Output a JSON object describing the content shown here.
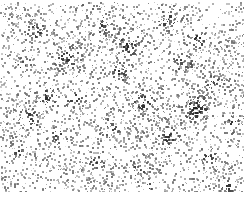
{
  "figure": {
    "title": "",
    "caption": "",
    "width": 251,
    "height": 197,
    "background_color": "#ffffff",
    "dot_color": "#6e6e6e",
    "dot_color_dark": "#1a1a1a",
    "frame": "none",
    "axes_visible": false,
    "ticks_visible": false,
    "labels_visible": false
  },
  "chart_data": {
    "type": "scatter",
    "title": "",
    "subtitle": "",
    "xlabel": "",
    "ylabel": "",
    "xlim": [
      0,
      251
    ],
    "ylim": [
      0,
      197
    ],
    "grid": false,
    "legend": null,
    "annotations": [],
    "tick_labels_x": [],
    "tick_labels_y": [],
    "description": "Dense two-dimensional random point pattern: roughly 3800 small grey markers scattered across a white field, with clustered over-dense knots and low-density voids.",
    "marker": {
      "shape": "square",
      "size_px": 2,
      "base_color": "#6e6e6e",
      "cluster_color": "#1a1a1a",
      "opacity_range": [
        0.35,
        1.0
      ]
    },
    "point_count": 3800,
    "content_bounds": {
      "left": 0,
      "top": 2,
      "right": 244,
      "bottom": 192
    },
    "margins": {
      "left": 0,
      "top": 2,
      "right": 7,
      "bottom": 5
    },
    "field": {
      "seed": 20240917,
      "base_density": 0.0825,
      "background_jitter": 0.55
    },
    "clusters": [
      {
        "cx": 36,
        "cy": 30,
        "radius": 9,
        "weight": 0.55,
        "darkness": 0.85
      },
      {
        "cx": 66,
        "cy": 57,
        "radius": 11,
        "weight": 0.6,
        "darkness": 0.8
      },
      {
        "cx": 22,
        "cy": 64,
        "radius": 8,
        "weight": 0.5,
        "darkness": 0.9
      },
      {
        "cx": 46,
        "cy": 96,
        "radius": 10,
        "weight": 0.55,
        "darkness": 0.8
      },
      {
        "cx": 74,
        "cy": 98,
        "radius": 8,
        "weight": 0.45,
        "darkness": 0.75
      },
      {
        "cx": 29,
        "cy": 118,
        "radius": 9,
        "weight": 0.5,
        "darkness": 0.85
      },
      {
        "cx": 57,
        "cy": 135,
        "radius": 8,
        "weight": 0.45,
        "darkness": 0.7
      },
      {
        "cx": 18,
        "cy": 152,
        "radius": 7,
        "weight": 0.4,
        "darkness": 0.75
      },
      {
        "cx": 101,
        "cy": 24,
        "radius": 9,
        "weight": 0.45,
        "darkness": 0.7
      },
      {
        "cx": 126,
        "cy": 44,
        "radius": 11,
        "weight": 0.6,
        "darkness": 0.85
      },
      {
        "cx": 118,
        "cy": 72,
        "radius": 9,
        "weight": 0.5,
        "darkness": 0.75
      },
      {
        "cx": 142,
        "cy": 101,
        "radius": 10,
        "weight": 0.55,
        "darkness": 0.85
      },
      {
        "cx": 109,
        "cy": 128,
        "radius": 9,
        "weight": 0.45,
        "darkness": 0.7
      },
      {
        "cx": 96,
        "cy": 160,
        "radius": 8,
        "weight": 0.45,
        "darkness": 0.75
      },
      {
        "cx": 139,
        "cy": 168,
        "radius": 8,
        "weight": 0.4,
        "darkness": 0.7
      },
      {
        "cx": 168,
        "cy": 20,
        "radius": 10,
        "weight": 0.55,
        "darkness": 0.8
      },
      {
        "cx": 197,
        "cy": 38,
        "radius": 9,
        "weight": 0.5,
        "darkness": 0.8
      },
      {
        "cx": 183,
        "cy": 63,
        "radius": 9,
        "weight": 0.5,
        "darkness": 0.75
      },
      {
        "cx": 213,
        "cy": 83,
        "radius": 9,
        "weight": 0.45,
        "darkness": 0.7
      },
      {
        "cx": 196,
        "cy": 108,
        "radius": 12,
        "weight": 0.7,
        "darkness": 0.95
      },
      {
        "cx": 168,
        "cy": 137,
        "radius": 9,
        "weight": 0.5,
        "darkness": 0.8
      },
      {
        "cx": 206,
        "cy": 156,
        "radius": 8,
        "weight": 0.45,
        "darkness": 0.75
      },
      {
        "cx": 232,
        "cy": 122,
        "radius": 8,
        "weight": 0.45,
        "darkness": 0.8
      },
      {
        "cx": 150,
        "cy": 188,
        "radius": 7,
        "weight": 0.4,
        "darkness": 0.7
      },
      {
        "cx": 84,
        "cy": 8,
        "radius": 7,
        "weight": 0.35,
        "darkness": 0.65
      },
      {
        "cx": 228,
        "cy": 186,
        "radius": 7,
        "weight": 0.4,
        "darkness": 0.75
      }
    ],
    "voids": [
      {
        "cx": 95,
        "cy": 92,
        "radius": 16,
        "depth": 0.55
      },
      {
        "cx": 160,
        "cy": 60,
        "radius": 13,
        "depth": 0.45
      },
      {
        "cx": 60,
        "cy": 78,
        "radius": 11,
        "depth": 0.4
      },
      {
        "cx": 180,
        "cy": 93,
        "radius": 12,
        "depth": 0.45
      },
      {
        "cx": 120,
        "cy": 150,
        "radius": 13,
        "depth": 0.45
      },
      {
        "cx": 40,
        "cy": 55,
        "radius": 10,
        "depth": 0.35
      },
      {
        "cx": 215,
        "cy": 132,
        "radius": 11,
        "depth": 0.4
      },
      {
        "cx": 70,
        "cy": 168,
        "radius": 12,
        "depth": 0.4
      },
      {
        "cx": 205,
        "cy": 22,
        "radius": 10,
        "depth": 0.35
      },
      {
        "cx": 136,
        "cy": 18,
        "radius": 10,
        "depth": 0.35
      },
      {
        "cx": 14,
        "cy": 96,
        "radius": 9,
        "depth": 0.35
      },
      {
        "cx": 172,
        "cy": 178,
        "radius": 10,
        "depth": 0.35
      }
    ]
  }
}
